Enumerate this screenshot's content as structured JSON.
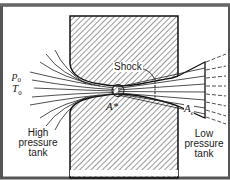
{
  "diagram": {
    "type": "converging-diverging nozzle flow between tanks",
    "labels": {
      "p0": "p",
      "p0_sub": "0",
      "t0": "T",
      "t0_sub": "0",
      "shock": "Shock",
      "a_star": "A*",
      "a_e": "A",
      "a_e_sub": "e",
      "high_tank": [
        "High",
        "pressure",
        "tank"
      ],
      "low_tank": [
        "Low",
        "pressure",
        "tank"
      ]
    },
    "colors": {
      "ink": "#1a1a1a",
      "frame": "#555555",
      "background": "#ffffff"
    }
  }
}
